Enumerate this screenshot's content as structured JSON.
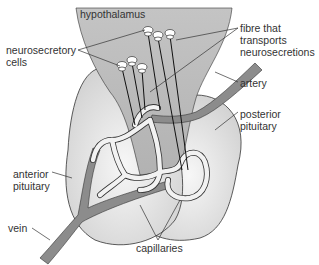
{
  "labels": {
    "hypothalamus": "hypothalamus",
    "neurosecretory_cells": [
      "neurosecretory",
      "cells"
    ],
    "fibre": [
      "fibre that",
      "transports",
      "neurosecretions"
    ],
    "artery": "artery",
    "posterior_pituitary": [
      "posterior",
      "pituitary"
    ],
    "anterior_pituitary": [
      "anterior",
      "pituitary"
    ],
    "vein": "vein",
    "capillaries": "capillaries"
  },
  "colors": {
    "hypothalamus_fill": "#bdbdbd",
    "pituitary_fill": "#e6e6e6",
    "vessel_fill": "#8c8c8c",
    "capillary_fill": "#f2f2f2",
    "outline": "#333333",
    "text": "#333333"
  }
}
